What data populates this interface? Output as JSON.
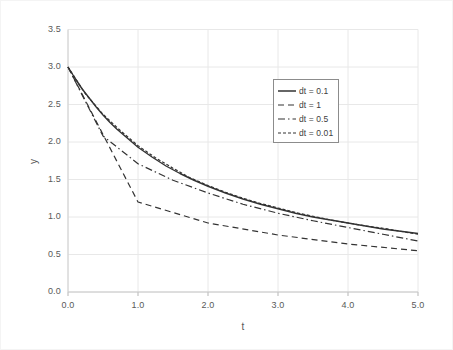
{
  "chart_data": {
    "type": "line",
    "title": "",
    "xlabel": "t",
    "ylabel": "y",
    "xlim": [
      0.0,
      5.0
    ],
    "ylim": [
      0.0,
      3.5
    ],
    "xticks": [
      "0.0",
      "1.0",
      "2.0",
      "3.0",
      "4.0",
      "5.0"
    ],
    "yticks": [
      "0.0",
      "0.5",
      "1.0",
      "1.5",
      "2.0",
      "2.5",
      "3.0",
      "3.5"
    ],
    "xtick_values": [
      0.0,
      1.0,
      2.0,
      3.0,
      4.0,
      5.0
    ],
    "ytick_values": [
      0.0,
      0.5,
      1.0,
      1.5,
      2.0,
      2.5,
      3.0,
      3.5
    ],
    "grid": true,
    "grid_color": "#e8e8e8",
    "legend_position": "upper-right",
    "line_color": "#333333",
    "series": [
      {
        "name": "dt = 0.1",
        "style": "solid",
        "x": [
          0.0,
          0.1,
          0.2,
          0.3,
          0.4,
          0.5,
          0.6,
          0.7,
          0.8,
          0.9,
          1.0,
          1.2,
          1.4,
          1.6,
          1.8,
          2.0,
          2.25,
          2.5,
          2.75,
          3.0,
          3.25,
          3.5,
          3.75,
          4.0,
          4.25,
          4.5,
          4.75,
          5.0
        ],
        "values": [
          3.0,
          2.85,
          2.71,
          2.59,
          2.47,
          2.36,
          2.26,
          2.17,
          2.09,
          2.01,
          1.93,
          1.8,
          1.68,
          1.58,
          1.49,
          1.41,
          1.32,
          1.24,
          1.17,
          1.11,
          1.05,
          1.0,
          0.96,
          0.92,
          0.88,
          0.84,
          0.81,
          0.78
        ]
      },
      {
        "name": "dt = 1",
        "style": "dashed",
        "x": [
          0.0,
          1.0,
          2.0,
          3.0,
          4.0,
          5.0
        ],
        "values": [
          3.0,
          1.2,
          0.92,
          0.76,
          0.64,
          0.55
        ]
      },
      {
        "name": "dt = 0.5",
        "style": "dashdot",
        "x": [
          0.0,
          0.5,
          1.0,
          1.5,
          2.0,
          2.5,
          3.0,
          3.5,
          4.0,
          4.5,
          5.0
        ],
        "values": [
          3.0,
          2.08,
          1.71,
          1.49,
          1.32,
          1.17,
          1.05,
          0.95,
          0.86,
          0.77,
          0.68
        ]
      },
      {
        "name": "dt = 0.01",
        "style": "dotted",
        "x": [
          0.0,
          0.25,
          0.5,
          0.75,
          1.0,
          1.25,
          1.5,
          1.75,
          2.0,
          2.25,
          2.5,
          2.75,
          3.0,
          3.25,
          3.5,
          3.75,
          4.0,
          4.25,
          4.5,
          4.75,
          5.0
        ],
        "values": [
          3.0,
          2.64,
          2.37,
          2.15,
          1.95,
          1.79,
          1.65,
          1.52,
          1.42,
          1.33,
          1.25,
          1.18,
          1.12,
          1.06,
          1.01,
          0.96,
          0.92,
          0.88,
          0.85,
          0.81,
          0.77
        ]
      }
    ],
    "legend_entries": [
      {
        "label": "dt = 0.1",
        "style": "solid"
      },
      {
        "label": "dt = 1",
        "style": "dashed"
      },
      {
        "label": "dt = 0.5",
        "style": "dashdot"
      },
      {
        "label": "dt = 0.01",
        "style": "dotted"
      }
    ]
  }
}
